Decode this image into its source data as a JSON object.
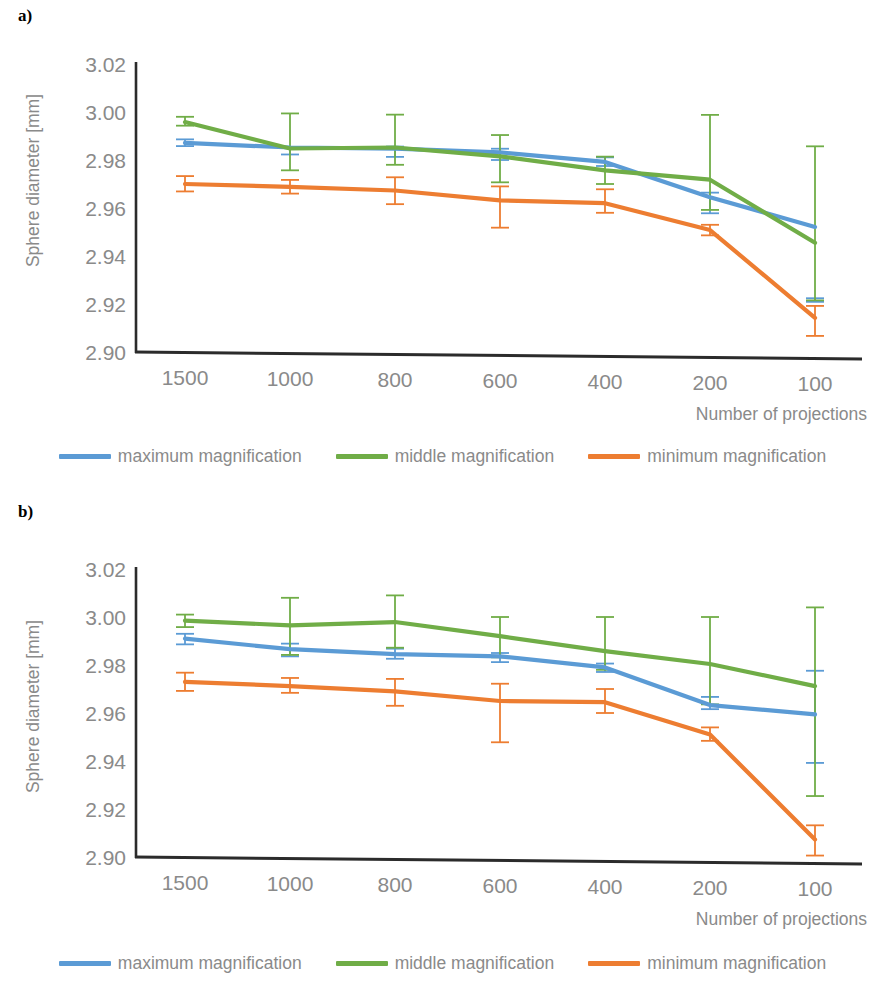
{
  "figure": {
    "panels": [
      {
        "marker": "a)",
        "axis": {
          "ylabel": "Sphere diameter [mm]",
          "xlabel": "Number of projections",
          "yticks": [
            "3.02",
            "3.00",
            "2.98",
            "2.96",
            "2.94",
            "2.92",
            "2.90"
          ],
          "xticks": [
            "1500",
            "1000",
            "800",
            "600",
            "400",
            "200",
            "100"
          ]
        },
        "legend": [
          {
            "label": "maximum magnification",
            "color": "#5b9bd5"
          },
          {
            "label": "middle magnification",
            "color": "#70ad47"
          },
          {
            "label": "minimum magnification",
            "color": "#ed7d31"
          }
        ]
      },
      {
        "marker": "b)",
        "axis": {
          "ylabel": "Sphere diameter [mm]",
          "xlabel": "Number of projections",
          "yticks": [
            "3.02",
            "3.00",
            "2.98",
            "2.96",
            "2.94",
            "2.92",
            "2.90"
          ],
          "xticks": [
            "1500",
            "1000",
            "800",
            "600",
            "400",
            "200",
            "100"
          ]
        },
        "legend": [
          {
            "label": "maximum magnification",
            "color": "#5b9bd5"
          },
          {
            "label": "middle magnification",
            "color": "#70ad47"
          },
          {
            "label": "minimum magnification",
            "color": "#ed7d31"
          }
        ]
      }
    ]
  },
  "chart_data": [
    {
      "panel": "a)",
      "type": "line",
      "title": "",
      "xlabel": "Number of projections",
      "ylabel": "Sphere diameter [mm]",
      "categories": [
        "1500",
        "1000",
        "800",
        "600",
        "400",
        "200",
        "100"
      ],
      "ylim": [
        2.9,
        3.02
      ],
      "ytick_step": 0.02,
      "grid": false,
      "legend_position": "bottom",
      "errorbars": true,
      "series": [
        {
          "name": "maximum magnification",
          "color": "#5b9bd5",
          "values": [
            2.9871,
            2.9852,
            2.9847,
            2.9832,
            2.9792,
            2.9645,
            2.9521
          ],
          "err_low": [
            2.9858,
            2.9823,
            2.9813,
            2.98,
            2.9775,
            2.9578,
            2.9209
          ],
          "err_high": [
            2.9886,
            2.9852,
            2.9856,
            2.9847,
            2.9811,
            2.9664,
            2.9224
          ]
        },
        {
          "name": "middle magnification",
          "color": "#70ad47",
          "values": [
            2.9958,
            2.9848,
            2.9852,
            2.9815,
            2.9757,
            2.9718,
            2.9455
          ],
          "err_low": [
            2.9943,
            2.9757,
            2.978,
            2.9707,
            2.97,
            2.9592,
            2.9215
          ],
          "err_high": [
            2.998,
            2.9994,
            2.9989,
            2.9904,
            2.9814,
            2.9988,
            2.9857
          ]
        },
        {
          "name": "minimum magnification",
          "color": "#ed7d31",
          "values": [
            2.97,
            2.9688,
            2.9673,
            2.9632,
            2.962,
            2.9508,
            2.9142
          ],
          "err_low": [
            2.9669,
            2.966,
            2.9616,
            2.9518,
            2.958,
            2.9486,
            2.9067
          ],
          "err_high": [
            2.9733,
            2.9717,
            2.9728,
            2.969,
            2.9678,
            2.953,
            2.9192
          ]
        }
      ]
    },
    {
      "panel": "b)",
      "type": "line",
      "title": "",
      "xlabel": "Number of projections",
      "ylabel": "Sphere diameter [mm]",
      "categories": [
        "1500",
        "1000",
        "800",
        "600",
        "400",
        "200",
        "100"
      ],
      "ylim": [
        2.9,
        3.02
      ],
      "ytick_step": 0.02,
      "grid": false,
      "legend_position": "bottom",
      "errorbars": true,
      "series": [
        {
          "name": "maximum magnification",
          "color": "#5b9bd5",
          "values": [
            2.991,
            2.9866,
            2.9845,
            2.9836,
            2.979,
            2.9633,
            2.9594
          ],
          "err_low": [
            2.9886,
            2.9836,
            2.9826,
            2.9812,
            2.9771,
            2.9616,
            2.9392
          ],
          "err_high": [
            2.993,
            2.9889,
            2.9868,
            2.985,
            2.9806,
            2.9667,
            2.9776
          ]
        },
        {
          "name": "middle magnification",
          "color": "#70ad47",
          "values": [
            2.9985,
            2.9965,
            2.9979,
            2.992,
            2.9858,
            2.9804,
            2.9712
          ],
          "err_low": [
            2.9958,
            2.9842,
            2.9872,
            2.9832,
            2.978,
            2.9636,
            2.9254
          ],
          "err_high": [
            3.001,
            3.008,
            3.009,
            3.0,
            3.0,
            3.0,
            3.004
          ]
        },
        {
          "name": "minimum magnification",
          "color": "#ed7d31",
          "values": [
            2.973,
            2.9712,
            2.969,
            2.965,
            2.9645,
            2.951,
            2.9073
          ],
          "err_low": [
            2.9692,
            2.9684,
            2.963,
            2.9478,
            2.96,
            2.9484,
            2.9006
          ],
          "err_high": [
            2.9768,
            2.9746,
            2.9742,
            2.9722,
            2.97,
            2.954,
            2.9132
          ]
        }
      ]
    }
  ]
}
